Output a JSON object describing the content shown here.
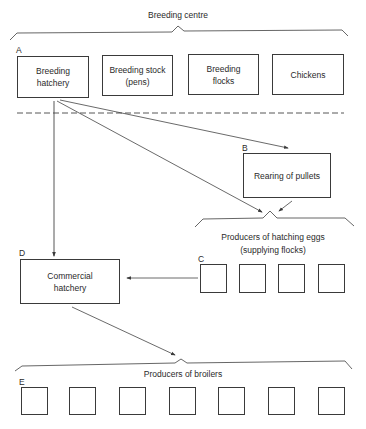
{
  "title": "Breeding centre",
  "breeding_centre": {
    "label": "A",
    "boxes": [
      {
        "text": "Breeding hatchery"
      },
      {
        "text": "Breeding stock (pens)"
      },
      {
        "text": "Breeding flocks"
      },
      {
        "text": "Chickens"
      }
    ]
  },
  "pullets": {
    "label": "B",
    "text": "Rearing of pullets"
  },
  "hatching_eggs": {
    "label": "C",
    "heading_line1": "Producers of hatching eggs",
    "heading_line2": "(supplying flocks)",
    "unit_count": 4
  },
  "commercial": {
    "label": "D",
    "text": "Commercial hatchery"
  },
  "broilers": {
    "label": "E",
    "heading": "Producers of broilers",
    "unit_count": 7
  },
  "colors": {
    "line": "#3a3a3a",
    "background": "#ffffff"
  }
}
